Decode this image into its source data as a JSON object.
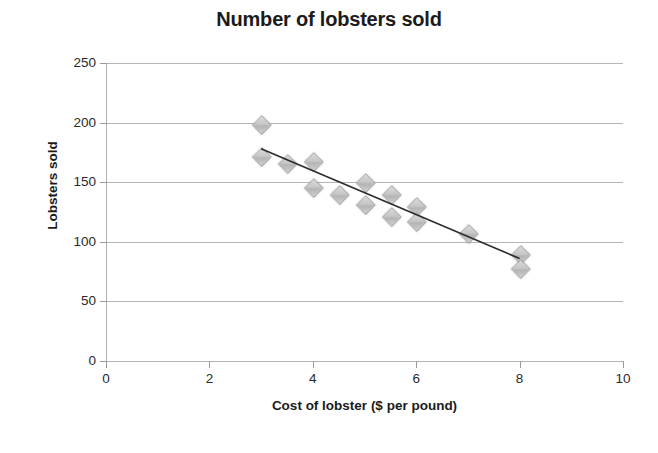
{
  "chart_data": {
    "type": "scatter",
    "title": "Number of lobsters sold",
    "xlabel": "Cost of lobster ($ per pound)",
    "ylabel": "Lobsters sold",
    "xlim": [
      0,
      10
    ],
    "ylim": [
      0,
      250
    ],
    "xticks": [
      "0",
      "2",
      "4",
      "6",
      "8",
      "10"
    ],
    "yticks": [
      "0",
      "50",
      "100",
      "150",
      "200",
      "250"
    ],
    "xtick_values": [
      0,
      2,
      4,
      6,
      8,
      10
    ],
    "ytick_values": [
      0,
      50,
      100,
      150,
      200,
      250
    ],
    "grid": "horizontal",
    "legend": "none",
    "marker": "diamond",
    "marker_color": "#c6c6c6",
    "marker_edge_color": "#a8a8a8",
    "series": [
      {
        "name": "Lobsters sold",
        "points": [
          {
            "x": 3.0,
            "y": 199
          },
          {
            "x": 3.0,
            "y": 172
          },
          {
            "x": 3.5,
            "y": 166
          },
          {
            "x": 4.0,
            "y": 168
          },
          {
            "x": 4.0,
            "y": 146
          },
          {
            "x": 4.5,
            "y": 140
          },
          {
            "x": 5.0,
            "y": 150
          },
          {
            "x": 5.0,
            "y": 132
          },
          {
            "x": 5.5,
            "y": 140
          },
          {
            "x": 5.5,
            "y": 122
          },
          {
            "x": 6.0,
            "y": 130
          },
          {
            "x": 6.0,
            "y": 118
          },
          {
            "x": 7.0,
            "y": 108
          },
          {
            "x": 8.0,
            "y": 90
          },
          {
            "x": 8.0,
            "y": 78
          }
        ]
      }
    ],
    "trendline": {
      "type": "linear",
      "color": "#2b2b2b",
      "x_start": 3.0,
      "y_start": 178,
      "x_end": 8.0,
      "y_end": 86
    }
  }
}
